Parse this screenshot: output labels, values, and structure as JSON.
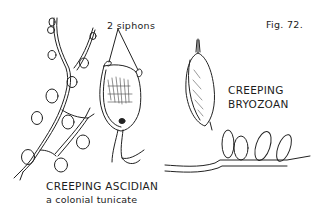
{
  "figure": {
    "number_label": "Fig. 72.",
    "callout_label": "2 siphons",
    "left_specimen": {
      "title": "CREEPING ASCIDIAN",
      "subtitle": "a colonial tunicate"
    },
    "right_specimen": {
      "title_line1": "CREEPING",
      "title_line2": "BRYOZOAN"
    },
    "colors": {
      "ink": "#1c1c1c",
      "background": "#ffffff"
    }
  }
}
